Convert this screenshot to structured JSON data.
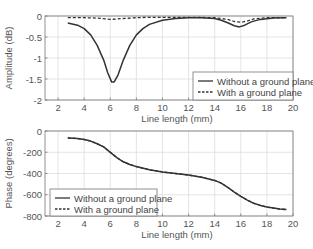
{
  "chart_data": [
    {
      "type": "line",
      "title": "",
      "xlabel": "Line length (mm)",
      "ylabel": "Amplitude (dB)",
      "xlim": [
        1,
        20
      ],
      "ylim": [
        -2,
        0
      ],
      "xticks": [
        2,
        4,
        6,
        8,
        10,
        12,
        14,
        16,
        18,
        20
      ],
      "yticks": [
        0,
        -0.5,
        -1,
        -1.5,
        -2
      ],
      "ytick_labels": [
        "0",
        "-0.5",
        "-1",
        "-1.5",
        "-2"
      ],
      "grid": true,
      "legend_position": "lower right",
      "series": [
        {
          "name": "Without a ground plane",
          "style": "solid",
          "x": [
            2.75,
            3.5,
            4,
            4.5,
            5,
            5.5,
            5.8,
            6.1,
            6.3,
            6.6,
            7,
            7.5,
            8,
            8.5,
            9,
            10,
            11,
            12,
            13,
            14,
            14.5,
            15,
            15.5,
            15.9,
            16.3,
            16.8,
            17.5,
            18.5,
            19.5
          ],
          "y": [
            -0.17,
            -0.22,
            -0.3,
            -0.45,
            -0.7,
            -1.05,
            -1.35,
            -1.57,
            -1.57,
            -1.4,
            -1.05,
            -0.7,
            -0.45,
            -0.3,
            -0.2,
            -0.1,
            -0.06,
            -0.04,
            -0.04,
            -0.06,
            -0.1,
            -0.16,
            -0.23,
            -0.26,
            -0.22,
            -0.14,
            -0.08,
            -0.05,
            -0.04
          ]
        },
        {
          "name": "With a ground plane",
          "style": "dashed",
          "x": [
            2.75,
            4,
            5,
            6,
            7,
            8,
            9,
            10,
            12,
            14,
            15,
            15.5,
            16,
            16.5,
            17,
            18,
            19.5
          ],
          "y": [
            -0.04,
            -0.04,
            -0.05,
            -0.08,
            -0.06,
            -0.04,
            -0.03,
            -0.03,
            -0.03,
            -0.04,
            -0.08,
            -0.13,
            -0.15,
            -0.12,
            -0.07,
            -0.04,
            -0.04
          ]
        }
      ]
    },
    {
      "type": "line",
      "title": "",
      "xlabel": "Line length (mm)",
      "ylabel": "Phase (degrees)",
      "xlim": [
        1,
        20
      ],
      "ylim": [
        -800,
        0
      ],
      "xticks": [
        2,
        4,
        6,
        8,
        10,
        12,
        14,
        16,
        18,
        20
      ],
      "yticks": [
        0,
        -200,
        -400,
        -600,
        -800
      ],
      "ytick_labels": [
        "0",
        "-200",
        "-400",
        "-600",
        "-800"
      ],
      "grid": true,
      "legend_position": "lower left",
      "series": [
        {
          "name": "Without a ground plane",
          "style": "solid",
          "x": [
            2.75,
            3.5,
            4,
            4.5,
            5,
            5.5,
            6,
            6.5,
            7,
            7.5,
            8,
            9,
            10,
            11,
            12,
            13,
            14,
            14.5,
            15,
            15.5,
            16,
            16.5,
            17,
            17.5,
            18,
            19,
            19.5
          ],
          "y": [
            -65,
            -72,
            -80,
            -95,
            -120,
            -150,
            -200,
            -250,
            -290,
            -315,
            -335,
            -365,
            -385,
            -400,
            -415,
            -435,
            -465,
            -490,
            -530,
            -575,
            -615,
            -650,
            -680,
            -700,
            -715,
            -735,
            -740
          ]
        },
        {
          "name": "With a ground plane",
          "style": "dashed",
          "x": [
            2.75,
            3.5,
            4,
            4.5,
            5,
            5.5,
            6,
            6.5,
            7,
            7.5,
            8,
            9,
            10,
            11,
            12,
            13,
            14,
            14.5,
            15,
            15.5,
            16,
            16.5,
            17,
            17.5,
            18,
            19,
            19.5
          ],
          "y": [
            -65,
            -72,
            -80,
            -95,
            -120,
            -150,
            -200,
            -250,
            -290,
            -315,
            -335,
            -365,
            -385,
            -400,
            -415,
            -435,
            -465,
            -490,
            -530,
            -575,
            -615,
            -650,
            -680,
            -700,
            -715,
            -735,
            -740
          ]
        }
      ]
    }
  ],
  "legend": {
    "items": [
      "Without a ground plane",
      "With a ground plane"
    ]
  },
  "colors": {
    "line": "#333333",
    "grid": "#dddddd",
    "axis": "#777777",
    "text": "#555555"
  }
}
